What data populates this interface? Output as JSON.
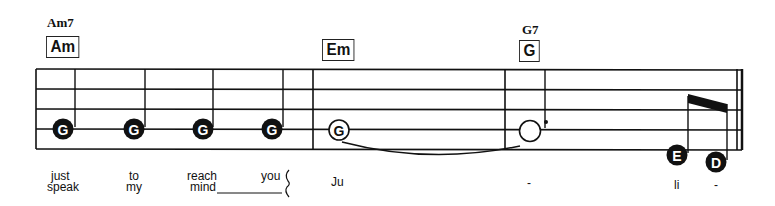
{
  "chords": [
    {
      "name": "Am7",
      "box": "Am"
    },
    {
      "name": "",
      "box": "Em"
    },
    {
      "name": "G7",
      "box": "G"
    }
  ],
  "notes": [
    {
      "letter": "G",
      "style": "filled"
    },
    {
      "letter": "G",
      "style": "filled"
    },
    {
      "letter": "G",
      "style": "filled"
    },
    {
      "letter": "G",
      "style": "filled"
    },
    {
      "letter": "G",
      "style": "hollow"
    },
    {
      "letter": "",
      "style": "hollow-dotted"
    },
    {
      "letter": "E",
      "style": "filled"
    },
    {
      "letter": "D",
      "style": "filled"
    }
  ],
  "lyrics": {
    "line1": [
      "just",
      "to",
      "reach",
      "you",
      "Ju",
      "-",
      "li",
      "-"
    ],
    "line2": [
      "speak",
      "my",
      "mind"
    ]
  },
  "colors": {
    "ink": "#111111",
    "background": "#ffffff"
  }
}
